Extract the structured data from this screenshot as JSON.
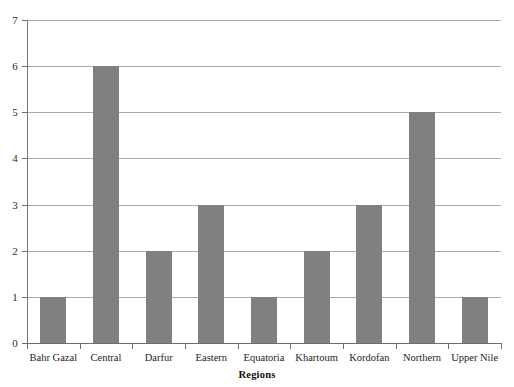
{
  "chart_data": {
    "type": "bar",
    "title": "",
    "subtitle": "",
    "xlabel": "Regions",
    "ylabel": "",
    "categories": [
      "Bahr Gazal",
      "Central",
      "Darfur",
      "Eastern",
      "Equatoria",
      "Khartoum",
      "Kordofan",
      "Northern",
      "Upper Nile"
    ],
    "values": [
      1,
      6,
      2,
      3,
      1,
      2,
      3,
      5,
      1
    ],
    "ylim": [
      0,
      7
    ],
    "ytick_labels": [
      "0",
      "1",
      "2",
      "3",
      "4",
      "5",
      "6",
      "7"
    ],
    "ytick_values": [
      0,
      1,
      2,
      3,
      4,
      5,
      6,
      7
    ],
    "grid": true,
    "grid_axis": "y",
    "legend": false,
    "legend_position": "none",
    "bar_color": "#808082",
    "gridline_color": "#aaaaac",
    "axis_color": "#6e6e70",
    "background_color": "#ffffff",
    "bar_width_ratio": 0.5
  },
  "axes": {
    "x_axis_title": "Regions"
  }
}
